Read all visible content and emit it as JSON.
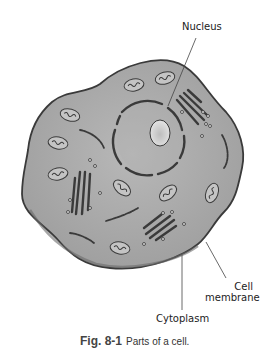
{
  "figure": {
    "number": "Fig. 8-1",
    "caption": "Parts of a cell."
  },
  "labels": {
    "nucleus": "Nucleus",
    "cell_membrane_line1": "Cell",
    "cell_membrane_line2": "membrane",
    "cytoplasm": "Cytoplasm"
  },
  "colors": {
    "cytoplasm": "#a9a9a9",
    "membrane": "#3a3a3a",
    "nucleolus": "#d8d8d8",
    "organelle": "#8a8a8a"
  }
}
